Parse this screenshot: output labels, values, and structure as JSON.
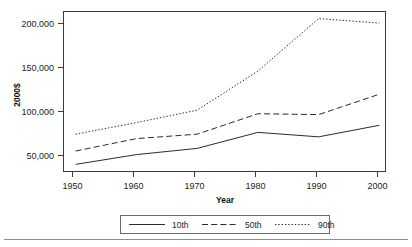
{
  "chart_data": {
    "type": "line",
    "title": "",
    "subtitle": "",
    "xlabel": "Year",
    "ylabel": "2000$",
    "x": [
      1950,
      1960,
      1970,
      1980,
      1990,
      2000
    ],
    "xlim": [
      1948,
      2001
    ],
    "ylim": [
      35000,
      215000
    ],
    "xticks": [
      1950,
      1960,
      1970,
      1980,
      1990,
      2000
    ],
    "xtick_labels": [
      "1950",
      "1960",
      "1970",
      "1980",
      "1990",
      "2000"
    ],
    "yticks": [
      50000,
      100000,
      150000,
      200000
    ],
    "ytick_labels": [
      "50,000",
      "100,000",
      "150,000",
      "200,000"
    ],
    "grid": false,
    "legend_position": "bottom-center",
    "series": [
      {
        "name": "10th",
        "style": "solid",
        "color": "#2b2b2b",
        "values": [
          43000,
          54000,
          61000,
          79000,
          74000,
          87000
        ]
      },
      {
        "name": "50th",
        "style": "dashed",
        "color": "#2b2b2b",
        "values": [
          58000,
          72000,
          77000,
          100000,
          99000,
          122000
        ]
      },
      {
        "name": "90th",
        "style": "dotted",
        "color": "#2b2b2b",
        "values": [
          77000,
          90000,
          104000,
          148000,
          207000,
          202000
        ]
      }
    ]
  },
  "legend": {
    "entries": [
      {
        "label": "10th"
      },
      {
        "label": "50th"
      },
      {
        "label": "90th"
      }
    ]
  },
  "axes": {
    "y_title": "2000$",
    "x_title": "Year"
  }
}
